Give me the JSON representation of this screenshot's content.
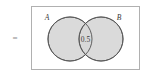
{
  "diagram": {
    "type": "venn",
    "equals_symbol": "=",
    "universe": {
      "name": "universal-set-rectangle",
      "x": 31,
      "y": 6,
      "width": 109,
      "height": 64,
      "stroke": "#b0b0b0",
      "fill": "#ffffff"
    },
    "sets": [
      {
        "label": "A",
        "cx": 70,
        "cy": 39,
        "r": 22,
        "fill": "#d8d8d8",
        "stroke": "#555555",
        "label_x": 47,
        "label_y": 20
      },
      {
        "label": "B",
        "cx": 101,
        "cy": 39,
        "r": 22,
        "fill": "#d8d8d8",
        "stroke": "#555555",
        "label_x": 119,
        "label_y": 20
      }
    ],
    "intersection": {
      "value": "0.5",
      "x": 85.5,
      "y": 41.5
    }
  }
}
